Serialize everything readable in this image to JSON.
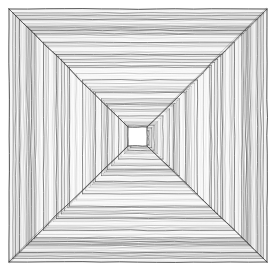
{
  "artwork": {
    "title": "Nested Concentric Squares Tunnel",
    "description": "Hand-drawn pen-and-ink illustration of concentric nested squares receding to a central vanishing point, each band filled with fine parallel hatching, with diagonal lines radiating from the four corners toward the center.",
    "medium": "pen and ink line drawing",
    "style": "one-point perspective tunnel / vortex",
    "background_color": "#ffffff",
    "ink_color": "#4a4a4a",
    "ink_color_light": "#9a9a9a",
    "ink_color_dark": "#2e2e2e",
    "canvas": {
      "width": 276,
      "height": 278
    },
    "composition": {
      "outer_left": 9,
      "outer_top": 9,
      "outer_right": 267,
      "outer_bottom": 262,
      "center_x": 137,
      "center_y": 136,
      "ring_count": 13,
      "innermost_square_size": 19,
      "hatch_lines_per_band": 7,
      "corner_diagonals": 4
    },
    "rings": [
      {
        "index": 0,
        "left": 9,
        "top": 9,
        "right": 267,
        "bottom": 262,
        "edge_color": "#3d3d3d"
      },
      {
        "index": 1,
        "left": 19.5,
        "top": 19.3,
        "right": 257.2,
        "bottom": 252.5,
        "edge_color": "#4a4a4a"
      },
      {
        "index": 2,
        "left": 31.2,
        "top": 30.4,
        "right": 246.1,
        "bottom": 241.7,
        "edge_color": "#4a4a4a"
      },
      {
        "index": 3,
        "left": 43.6,
        "top": 42.2,
        "right": 234.4,
        "bottom": 230.3,
        "edge_color": "#515151"
      },
      {
        "index": 4,
        "left": 56.4,
        "top": 54.5,
        "right": 222.3,
        "bottom": 218.5,
        "edge_color": "#515151"
      },
      {
        "index": 5,
        "left": 69.5,
        "top": 67.2,
        "right": 209.9,
        "bottom": 206.2,
        "edge_color": "#585858"
      },
      {
        "index": 6,
        "left": 82.6,
        "top": 80.0,
        "right": 197.4,
        "bottom": 193.8,
        "edge_color": "#585858"
      },
      {
        "index": 7,
        "left": 95.4,
        "top": 92.7,
        "right": 185.2,
        "bottom": 181.5,
        "edge_color": "#5f5f5f"
      },
      {
        "index": 8,
        "left": 107.6,
        "top": 104.9,
        "right": 173.5,
        "bottom": 169.7,
        "edge_color": "#5f5f5f"
      },
      {
        "index": 9,
        "left": 118.6,
        "top": 115.9,
        "right": 163.0,
        "bottom": 159.1,
        "edge_color": "#666666"
      },
      {
        "index": 10,
        "left": 127.9,
        "top": 125.2,
        "right": 154.1,
        "bottom": 150.2,
        "edge_color": "#666666"
      },
      {
        "index": 11,
        "left": 133.5,
        "top": 130.9,
        "right": 148.7,
        "bottom": 144.8,
        "edge_color": "#6d6d6d"
      },
      {
        "index": 12,
        "left": 127.5,
        "top": 126.5,
        "right": 146.5,
        "bottom": 145.5,
        "edge_color": "#5a5a5a"
      }
    ],
    "inner_square": {
      "left": 128,
      "top": 127,
      "right": 147,
      "bottom": 146,
      "fill": "#ffffff",
      "stroke": "#3f3f3f"
    },
    "labels": {
      "canvas_label": "drawing-canvas",
      "figure_label": "nested-squares-figure"
    }
  }
}
